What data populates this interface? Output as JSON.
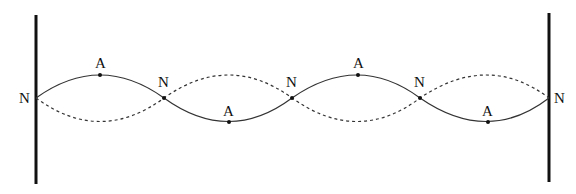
{
  "diagram": {
    "type": "standing-wave",
    "labels": {
      "node": "N",
      "antinode": "A"
    },
    "nodes": [
      {
        "x": 36,
        "y": 98,
        "label": "N",
        "lx": 19,
        "ly": 103
      },
      {
        "x": 164,
        "y": 98,
        "label": "N",
        "lx": 158,
        "ly": 87
      },
      {
        "x": 292,
        "y": 98,
        "label": "N",
        "lx": 286,
        "ly": 87
      },
      {
        "x": 420,
        "y": 98,
        "label": "N",
        "lx": 414,
        "ly": 87
      },
      {
        "x": 549,
        "y": 98,
        "label": "N",
        "lx": 554,
        "ly": 103
      }
    ],
    "antinodes": [
      {
        "x": 100,
        "y": 75,
        "label": "A",
        "lx": 95,
        "ly": 68
      },
      {
        "x": 229,
        "y": 122,
        "label": "A",
        "lx": 223,
        "ly": 116
      },
      {
        "x": 358,
        "y": 75,
        "label": "A",
        "lx": 353,
        "ly": 68
      },
      {
        "x": 488,
        "y": 122,
        "label": "A",
        "lx": 482,
        "ly": 116
      }
    ],
    "walls": [
      {
        "x": 36,
        "y1": 15,
        "y2": 184
      },
      {
        "x": 549,
        "y1": 13,
        "y2": 182
      }
    ],
    "colors": {
      "wall": "#111111",
      "wave": "#333333",
      "dot": "#111111"
    }
  }
}
